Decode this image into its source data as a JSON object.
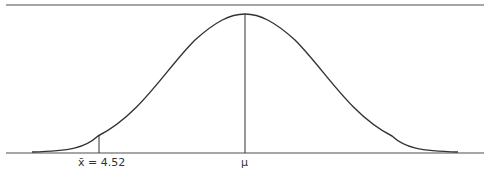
{
  "diagram": {
    "type": "normal-distribution-curve",
    "labels": {
      "sample_mean": "x̄ = 4.52",
      "population_mean": "μ"
    },
    "colors": {
      "curve": "#333333",
      "axis": "#888888",
      "top_line": "#888888"
    }
  }
}
